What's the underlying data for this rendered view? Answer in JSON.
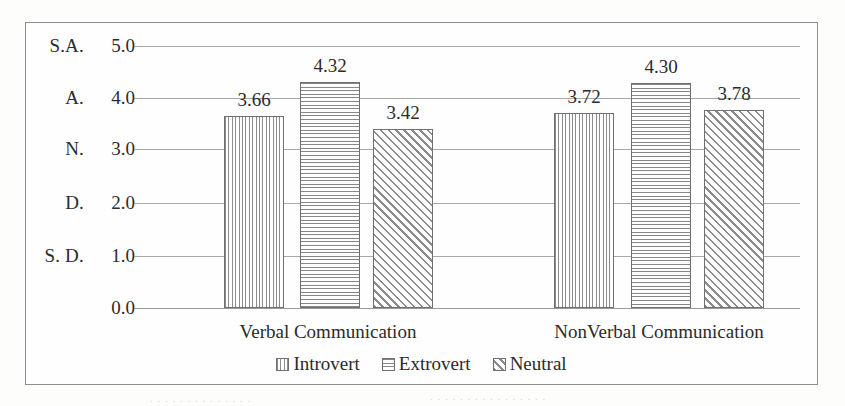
{
  "chart_data": {
    "type": "bar",
    "title": "",
    "xlabel": "",
    "ylabel": "",
    "categories": [
      "Verbal Communication",
      "NonVerbal Communication"
    ],
    "series": [
      {
        "name": "Introvert",
        "pattern": "vertical",
        "values": [
          3.66,
          3.72
        ]
      },
      {
        "name": "Extrovert",
        "pattern": "horizontal",
        "values": [
          4.32,
          4.3
        ]
      },
      {
        "name": "Neutral",
        "pattern": "diagonal",
        "values": [
          3.42,
          3.78
        ]
      }
    ],
    "value_labels": [
      [
        "3.66",
        "4.32",
        "3.42"
      ],
      [
        "3.72",
        "4.30",
        "3.78"
      ]
    ],
    "ylim": [
      0.0,
      5.0
    ],
    "y_ticks": [
      {
        "value": "5.0",
        "category": "S.A."
      },
      {
        "value": "4.0",
        "category": "A."
      },
      {
        "value": "3.0",
        "category": "N."
      },
      {
        "value": "2.0",
        "category": "D."
      },
      {
        "value": "1.0",
        "category": "S. D."
      },
      {
        "value": "0.0",
        "category": ""
      }
    ],
    "grid": true,
    "legend_position": "bottom",
    "legend": [
      "Introvert",
      "Extrovert",
      "Neutral"
    ],
    "colors": {
      "frame": "#8e8e8e",
      "gridline": "#a8a8a8",
      "bar_outline": "#6f6f6f",
      "hatch": "#8b8b8b",
      "background": "#fefefe",
      "text": "#2b2b2b"
    }
  },
  "layout": {
    "bar_groups": [
      {
        "label": "Verbal Communication",
        "center": 302,
        "bars": [
          {
            "x": 198,
            "w": 60
          },
          {
            "x": 274,
            "w": 60
          },
          {
            "x": 347,
            "w": 60
          }
        ]
      },
      {
        "label": "NonVerbal Communication",
        "center": 633,
        "bars": [
          {
            "x": 528,
            "w": 60
          },
          {
            "x": 605,
            "w": 60
          },
          {
            "x": 678,
            "w": 60
          }
        ]
      }
    ],
    "gridline_y": [
      23,
      75,
      126,
      180,
      233,
      285
    ],
    "baseline_y": 285,
    "px_per_unit": 52.4
  }
}
